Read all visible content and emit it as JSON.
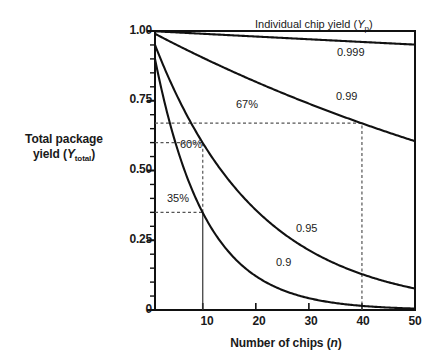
{
  "chart_data": {
    "type": "line",
    "title": "",
    "xlabel": "Number of chips (n)",
    "ylabel": "Total package yield (Ytotal)",
    "xlim": [
      1,
      50
    ],
    "ylim": [
      0,
      1.0
    ],
    "xticks": [
      10,
      20,
      30,
      40,
      50
    ],
    "xtick_labels": [
      "10",
      "20",
      "30",
      "40",
      "50"
    ],
    "yticks": [
      0,
      0.25,
      0.5,
      0.75,
      1.0
    ],
    "ytick_labels": [
      "0",
      "0.25",
      "0.50",
      "0.75",
      "1.00"
    ],
    "grid": false,
    "legend_position": "inline-curve-labels",
    "formula": "Ytotal = Yp^n",
    "series": [
      {
        "name": "0.999",
        "chip_yield": 0.999,
        "label": "0.999",
        "x": [
          1,
          5,
          10,
          15,
          20,
          25,
          30,
          35,
          40,
          45,
          50
        ],
        "values": [
          1.0,
          0.996,
          0.991,
          0.986,
          0.981,
          0.975,
          0.97,
          0.966,
          0.961,
          0.956,
          0.951
        ]
      },
      {
        "name": "0.99",
        "chip_yield": 0.99,
        "label": "0.99",
        "x": [
          1,
          5,
          10,
          15,
          20,
          25,
          30,
          35,
          40,
          45,
          50
        ],
        "values": [
          1.0,
          0.961,
          0.914,
          0.87,
          0.828,
          0.788,
          0.75,
          0.713,
          0.669,
          0.638,
          0.605
        ]
      },
      {
        "name": "0.95",
        "chip_yield": 0.95,
        "label": "0.95",
        "x": [
          1,
          5,
          10,
          15,
          20,
          25,
          30,
          35,
          40,
          45,
          50
        ],
        "values": [
          1.0,
          0.815,
          0.599,
          0.463,
          0.358,
          0.277,
          0.215,
          0.166,
          0.129,
          0.099,
          0.077
        ]
      },
      {
        "name": "0.9",
        "chip_yield": 0.9,
        "label": "0.9",
        "x": [
          1,
          5,
          10,
          15,
          20,
          25,
          30,
          35,
          40,
          45,
          50
        ],
        "values": [
          1.0,
          0.656,
          0.349,
          0.206,
          0.122,
          0.072,
          0.042,
          0.025,
          0.0148,
          0.0087,
          0.0052
        ]
      }
    ],
    "annotations": [
      {
        "name": "individual-chip-yield-header",
        "text": "Individual chip yield (Yp)",
        "text_parts": {
          "main": "Individual chip yield (Y",
          "sub": "p",
          "tail": ")"
        },
        "x_px": 255,
        "y_px": 24
      },
      {
        "name": "curve-label-0999",
        "text": "0.999",
        "x_px": 337,
        "y_px": 52
      },
      {
        "name": "curve-label-099",
        "text": "0.99",
        "x_px": 336,
        "y_px": 96
      },
      {
        "name": "curve-label-095",
        "text": "0.95",
        "x_px": 296,
        "y_px": 228
      },
      {
        "name": "curve-label-09",
        "text": "0.9",
        "x_px": 276,
        "y_px": 262
      },
      {
        "name": "pct-67",
        "text": "67%",
        "x_px": 236,
        "y_px": 104,
        "value": 0.67,
        "at_n": 40,
        "series": "0.99"
      },
      {
        "name": "pct-60",
        "text": "60%",
        "x_px": 180,
        "y_px": 144,
        "value": 0.6,
        "at_n": 10,
        "series": "0.95"
      },
      {
        "name": "pct-35",
        "text": "35%",
        "x_px": 167,
        "y_px": 198,
        "value": 0.35,
        "at_n": 10,
        "series": "0.9"
      }
    ],
    "guide_lines": [
      {
        "name": "hline-67",
        "orientation": "horizontal",
        "y_value": 0.67,
        "from_n": 1,
        "to_n": 40,
        "style": "dashed"
      },
      {
        "name": "hline-60",
        "orientation": "horizontal",
        "y_value": 0.6,
        "from_n": 1,
        "to_n": 10,
        "style": "dashed"
      },
      {
        "name": "hline-35",
        "orientation": "horizontal",
        "y_value": 0.35,
        "from_n": 1,
        "to_n": 10,
        "style": "dashed"
      },
      {
        "name": "vline-40",
        "orientation": "vertical",
        "x_value": 40,
        "from_y": 0,
        "to_y": 0.67,
        "style": "dashed"
      },
      {
        "name": "vline-10-dashed",
        "orientation": "vertical",
        "x_value": 10,
        "from_y": 0.35,
        "to_y": 0.6,
        "style": "dashed"
      },
      {
        "name": "vline-10-solid",
        "orientation": "vertical",
        "x_value": 10,
        "from_y": 0,
        "to_y": 0.35,
        "style": "solid"
      }
    ],
    "colors": {
      "curve": "#111111",
      "axis": "#111111",
      "guide": "#555555",
      "text": "#1a1a1a",
      "background": "#ffffff"
    }
  }
}
